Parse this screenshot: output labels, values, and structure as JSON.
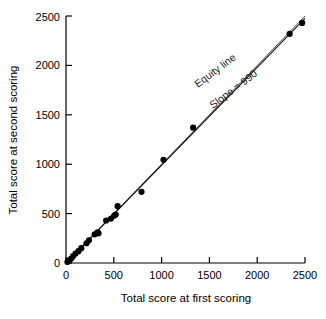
{
  "chart_data": {
    "type": "scatter",
    "title": "",
    "xlabel": "Total score at first scoring",
    "ylabel": "Total score at second scoring",
    "xlim": [
      0,
      2500
    ],
    "ylim": [
      0,
      2500
    ],
    "xticks": [
      0,
      500,
      1000,
      1500,
      2000,
      2500
    ],
    "yticks": [
      0,
      500,
      1000,
      1500,
      2000,
      2500
    ],
    "xtick_labels": [
      "0",
      "500",
      "1000",
      "1500",
      "2000",
      "2500"
    ],
    "ytick_labels": [
      "0",
      "500",
      "1000",
      "1500",
      "2000",
      "2500"
    ],
    "grid": false,
    "legend": "none",
    "points": [
      {
        "x": 15,
        "y": 10
      },
      {
        "x": 35,
        "y": 30
      },
      {
        "x": 55,
        "y": 45
      },
      {
        "x": 75,
        "y": 70
      },
      {
        "x": 100,
        "y": 95
      },
      {
        "x": 130,
        "y": 120
      },
      {
        "x": 160,
        "y": 150
      },
      {
        "x": 215,
        "y": 200
      },
      {
        "x": 240,
        "y": 230
      },
      {
        "x": 300,
        "y": 290
      },
      {
        "x": 330,
        "y": 310
      },
      {
        "x": 340,
        "y": 300
      },
      {
        "x": 420,
        "y": 430
      },
      {
        "x": 470,
        "y": 450
      },
      {
        "x": 505,
        "y": 480
      },
      {
        "x": 520,
        "y": 490
      },
      {
        "x": 540,
        "y": 575
      },
      {
        "x": 790,
        "y": 720
      },
      {
        "x": 1020,
        "y": 1045
      },
      {
        "x": 1330,
        "y": 1370
      },
      {
        "x": 2340,
        "y": 2320
      },
      {
        "x": 2470,
        "y": 2430
      }
    ],
    "lines": [
      {
        "name": "equity-line",
        "label": "Equity line",
        "slope": 1.0,
        "intercept": 0,
        "x_from": 0,
        "x_to": 2500,
        "color": "#555555"
      },
      {
        "name": "regression-line",
        "label": "Slope = 990",
        "slope": 0.99,
        "intercept": 0,
        "x_from": 0,
        "x_to": 2500,
        "color": "#111111"
      }
    ],
    "annotations": [
      {
        "name": "equity-line-annotation",
        "text": "Equity line",
        "rotation": -37
      },
      {
        "name": "slope-annotation",
        "text": "Slope = 990",
        "rotation": -37
      }
    ]
  }
}
